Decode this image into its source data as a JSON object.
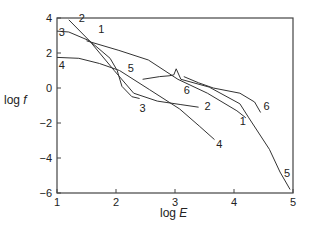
{
  "chart_data": {
    "type": "line",
    "title": "",
    "xlabel": "log E",
    "ylabel": "log f",
    "xlim": [
      1,
      5
    ],
    "ylim": [
      -6,
      4
    ],
    "xticks": [
      1,
      2,
      3,
      4,
      5
    ],
    "yticks": [
      -6,
      -4,
      -2,
      0,
      2,
      4
    ],
    "grid": false,
    "legend": "inline numeric labels on curves",
    "series": [
      {
        "name": "1",
        "label_pos": [
          1.75,
          3.15
        ],
        "end_label_pos": [
          4.15,
          -2.1
        ],
        "x": [
          1.5,
          2.05,
          2.55,
          3.05,
          3.55,
          4.05,
          4.2
        ],
        "y": [
          2.7,
          2.15,
          1.6,
          0.5,
          -0.3,
          -1.3,
          -1.7
        ]
      },
      {
        "name": "2",
        "label_pos": [
          1.42,
          3.75
        ],
        "end_label_pos": [
          3.55,
          -1.25
        ],
        "x": [
          1.2,
          1.55,
          1.97,
          2.3,
          2.7,
          3.1,
          3.4
        ],
        "y": [
          3.9,
          2.7,
          1.0,
          -0.3,
          -0.75,
          -0.95,
          -1.1
        ]
      },
      {
        "name": "3",
        "label_pos": [
          1.08,
          2.95
        ],
        "end_label_pos": [
          2.45,
          -1.35
        ],
        "x": [
          1.0,
          1.2,
          1.55,
          1.9,
          2.02,
          2.1,
          2.27,
          2.4
        ],
        "y": [
          3.25,
          3.2,
          2.7,
          1.7,
          1.0,
          0.1,
          -0.5,
          -0.6
        ]
      },
      {
        "name": "4",
        "label_pos": [
          1.08,
          1.1
        ],
        "end_label_pos": [
          3.75,
          -3.45
        ],
        "x": [
          1.0,
          1.37,
          1.72,
          2.06,
          2.57,
          3.08,
          3.42,
          3.67
        ],
        "y": [
          1.75,
          1.7,
          1.4,
          1.0,
          -0.1,
          -1.2,
          -2.2,
          -2.95
        ]
      },
      {
        "name": "5",
        "label_pos": [
          2.25,
          0.9
        ],
        "end_label_pos": [
          4.9,
          -5.1
        ],
        "x": [
          2.45,
          2.74,
          2.9,
          2.98,
          3.02,
          3.1,
          3.58,
          4.1,
          4.25,
          4.6,
          4.78,
          4.95
        ],
        "y": [
          0.5,
          0.65,
          0.7,
          0.75,
          1.1,
          0.5,
          0.05,
          -0.9,
          -1.7,
          -3.5,
          -4.8,
          -5.8
        ]
      },
      {
        "name": "6",
        "label_pos": [
          3.2,
          -0.35
        ],
        "end_label_pos": [
          4.55,
          -1.25
        ],
        "x": [
          3.15,
          3.4,
          3.65,
          4.1,
          4.35,
          4.45
        ],
        "y": [
          0.65,
          0.3,
          0.0,
          -0.3,
          -0.8,
          -1.4
        ]
      }
    ]
  }
}
